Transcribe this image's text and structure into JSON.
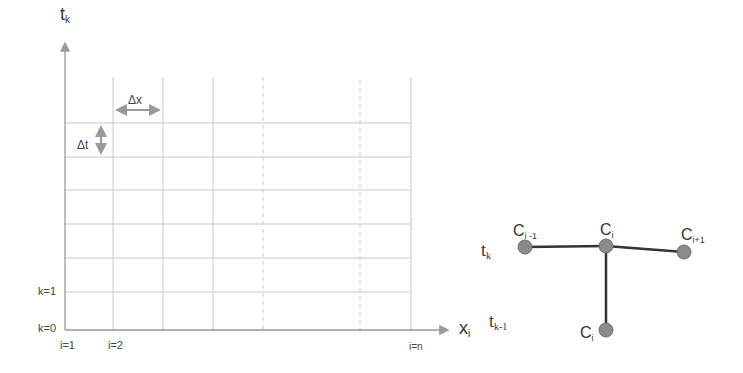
{
  "grid": {
    "y_axis_label": "t",
    "y_axis_sub": "k",
    "x_axis_label": "x",
    "x_axis_sub": "i",
    "dx_label": "Δx",
    "dt_label": "Δt",
    "row_labels": [
      "k=1",
      "k=0"
    ],
    "col_labels": [
      "i=1",
      "i=2",
      "i=n"
    ],
    "colors": {
      "grid": "#c8c8c8",
      "axis": "#999999",
      "arrow": "#999999"
    }
  },
  "stencil": {
    "row_top": {
      "t": "t",
      "sub": "k"
    },
    "row_bottom": {
      "t": "t",
      "sub": "k-1"
    },
    "nodes": [
      {
        "label": "C",
        "sub": "i -1"
      },
      {
        "label": "C",
        "sub": "i"
      },
      {
        "label": "C",
        "sub": "i+1"
      },
      {
        "label": "C",
        "sub": "i"
      }
    ],
    "colors": {
      "node": "#8a8a8a",
      "node_edge": "#6e6e6e",
      "edge": "#333333"
    }
  }
}
